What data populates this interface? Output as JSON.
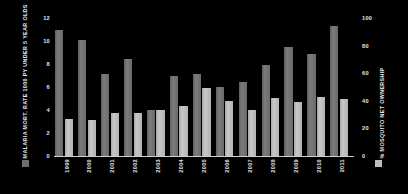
{
  "chart_data": {
    "type": "bar",
    "title": "",
    "subtitle": "",
    "categories": [
      "1999",
      "2000",
      "2001",
      "2002",
      "2003",
      "2004",
      "2005",
      "2006",
      "2007",
      "2008",
      "2009",
      "2010",
      "2011"
    ],
    "series": [
      {
        "name": "MALARIA MORT. RATE 1000 PY UNDER 5 YEAR OLDS",
        "axis": "left",
        "color": "#6e6e6e",
        "values": [
          11.0,
          10.1,
          7.1,
          8.4,
          4.0,
          7.0,
          7.1,
          6.0,
          6.4,
          7.9,
          9.5,
          8.9,
          11.3
        ]
      },
      {
        "name": "% MOSQUITO NET OWNERSHIP",
        "axis": "right",
        "color": "#bdbdbd",
        "values": [
          27,
          26,
          31,
          31,
          33,
          36,
          49,
          40,
          33,
          42,
          39,
          43,
          41
        ]
      }
    ],
    "left_axis": {
      "label": "MALARIA MORT. RATE 1000 PY UNDER 5 YEAR OLDS",
      "ticks": [
        "12",
        "10",
        "8",
        "6",
        "4",
        "2",
        "0"
      ],
      "min": 0,
      "max": 12
    },
    "right_axis": {
      "label": "% MOSQUITO NET OWNERSHIP",
      "ticks": [
        "100",
        "80",
        "60",
        "40",
        "20",
        "0"
      ],
      "min": 0,
      "max": 100
    },
    "xlabel": "",
    "grid": false,
    "legend_position": "axis-titles",
    "background_color": "#000000"
  },
  "legend": {
    "left_swatch_name": "malaria-mortality-swatch",
    "right_swatch_name": "mosquito-net-swatch"
  }
}
